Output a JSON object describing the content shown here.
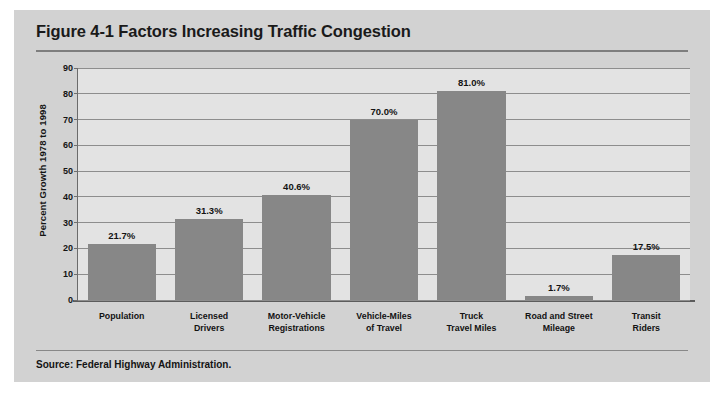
{
  "figure": {
    "title": "Figure 4-1 Factors Increasing Traffic Congestion",
    "source": "Source: Federal Highway Administration."
  },
  "colors": {
    "panel_background": "#d2d2d2",
    "plot_background": "#e3e3e3",
    "bar_fill": "#878787",
    "gridline": "#8d8d8d",
    "text": "#141414"
  },
  "chart_data": {
    "type": "bar",
    "title": "Figure 4-1 Factors Increasing Traffic Congestion",
    "xlabel": "",
    "ylabel": "Percent Growth 1978 to 1998",
    "ylim": [
      0,
      90
    ],
    "ytick_step": 10,
    "yticks": [
      0,
      10,
      20,
      30,
      40,
      50,
      60,
      70,
      80,
      90
    ],
    "ytick_labels": [
      "0",
      "10",
      "20",
      "30",
      "40",
      "50",
      "60",
      "70",
      "80",
      "90"
    ],
    "grid": true,
    "legend": false,
    "categories": [
      "Population",
      "Licensed Drivers",
      "Motor-Vehicle Registrations",
      "Vehicle-Miles of Travel",
      "Truck Travel Miles",
      "Road and Street Mileage",
      "Transit Riders"
    ],
    "category_lines": [
      [
        "Population"
      ],
      [
        "Licensed",
        "Drivers"
      ],
      [
        "Motor-Vehicle",
        "Registrations"
      ],
      [
        "Vehicle-Miles",
        "of Travel"
      ],
      [
        "Truck",
        "Travel Miles"
      ],
      [
        "Road and Street",
        "Mileage"
      ],
      [
        "Transit",
        "Riders"
      ]
    ],
    "values": [
      21.7,
      31.3,
      40.6,
      70.0,
      81.0,
      1.7,
      17.5
    ],
    "value_labels": [
      "21.7%",
      "31.3%",
      "40.6%",
      "70.0%",
      "81.0%",
      "1.7%",
      "17.5%"
    ]
  }
}
